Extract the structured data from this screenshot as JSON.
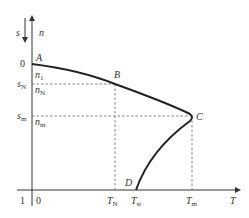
{
  "diagram": {
    "type": "torque-slip characteristic",
    "axes": {
      "vertical_left": "s",
      "vertical_right": "n",
      "horizontal": "T",
      "origin_top": "0",
      "origin_bottom_left": "1",
      "origin_bottom_right": "0"
    },
    "points": {
      "A": "A",
      "B": "B",
      "C": "C",
      "D": "D"
    },
    "y_labels": {
      "n1": {
        "base": "n",
        "sub": "1"
      },
      "sN": {
        "base": "s",
        "sub": "N"
      },
      "nN": {
        "base": "n",
        "sub": "N"
      },
      "sm": {
        "base": "s",
        "sub": "m"
      },
      "nm": {
        "base": "n",
        "sub": "m"
      }
    },
    "x_labels": {
      "TN": {
        "base": "T",
        "sub": "N"
      },
      "Tst": {
        "base": "T",
        "sub": "st"
      },
      "Tm": {
        "base": "T",
        "sub": "m"
      }
    }
  }
}
